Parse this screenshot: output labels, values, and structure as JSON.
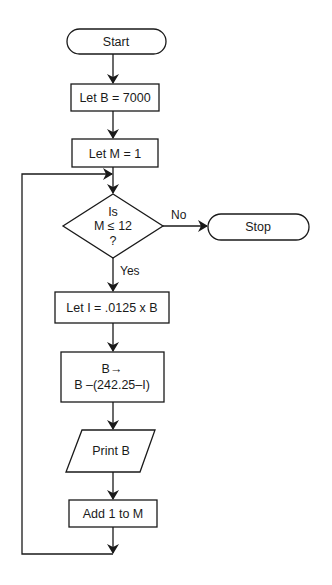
{
  "diagram": {
    "type": "flowchart",
    "nodes": {
      "start": {
        "label": "Start",
        "shape": "terminal"
      },
      "init_b": {
        "label": "Let B = 7000",
        "shape": "process"
      },
      "init_m": {
        "label": "Let M = 1",
        "shape": "process"
      },
      "decision": {
        "line1": "Is",
        "line2": "M ≤ 12",
        "line3": "?",
        "shape": "decision"
      },
      "stop": {
        "label": "Stop",
        "shape": "terminal"
      },
      "calc_i": {
        "label": "Let I = .0125 x B",
        "shape": "process"
      },
      "update_b": {
        "line1": "B→",
        "line2": "B –(242.25–I)",
        "shape": "process"
      },
      "print_b": {
        "label": "Print B",
        "shape": "io"
      },
      "inc_m": {
        "label": "Add 1 to M",
        "shape": "process"
      }
    },
    "edge_labels": {
      "no": "No",
      "yes": "Yes"
    }
  }
}
